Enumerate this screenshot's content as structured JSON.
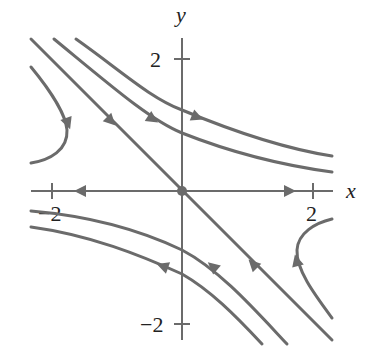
{
  "figure": {
    "type": "phase-portrait",
    "axes": {
      "x_label": "x",
      "y_label": "y",
      "x_ticks": [
        {
          "value": -2,
          "label": "−2"
        },
        {
          "value": 2,
          "label": "2"
        }
      ],
      "y_ticks": [
        {
          "value": 2,
          "label": "2"
        },
        {
          "value": -2,
          "label": "−2"
        }
      ]
    },
    "equilibrium": {
      "x": 0,
      "y": 0,
      "kind": "saddle"
    },
    "trajectories": [
      {
        "id": "stable-line",
        "description": "diagonal through origin, flows toward origin"
      },
      {
        "id": "unstable-line",
        "description": "x-axis, flows away from origin"
      },
      {
        "id": "upper-left-hook"
      },
      {
        "id": "upper-curve-1"
      },
      {
        "id": "upper-curve-2"
      },
      {
        "id": "lower-curve-1"
      },
      {
        "id": "lower-curve-2"
      },
      {
        "id": "lower-right-hook"
      }
    ],
    "colors": {
      "curve": "#6b6b6b",
      "text": "#222222",
      "background": "#ffffff"
    }
  }
}
